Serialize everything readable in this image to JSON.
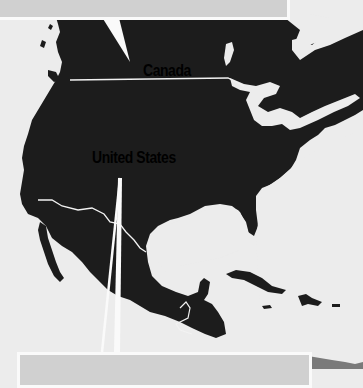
{
  "map": {
    "region": "North America",
    "land_color": "#1c1c1c",
    "water_color": "#ececec",
    "border_color": "#f2f2f2",
    "south_america_color": "#7a7a7a",
    "callout_fill": "#d0d0d0",
    "callout_border": "#fafafa",
    "labels": {
      "canada": "Canada",
      "united_states": "United States"
    },
    "callouts": [
      {
        "position": "top",
        "text": ""
      },
      {
        "position": "bottom",
        "text": ""
      }
    ]
  }
}
